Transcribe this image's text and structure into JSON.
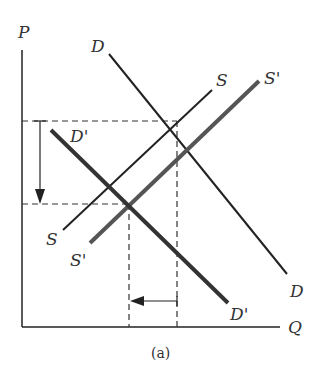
{
  "figure": {
    "caption": "(a)",
    "axes": {
      "y_label": "P",
      "x_label": "Q"
    },
    "curves": {
      "demand": {
        "label_top": "D",
        "label_bottom": "D"
      },
      "demand_shifted": {
        "label_top": "D'",
        "label_bottom": "D'"
      },
      "supply": {
        "label_top": "S",
        "label_bottom": "S"
      },
      "supply_shifted": {
        "label_top": "S'",
        "label_bottom": "S'"
      }
    },
    "annotations": {
      "price_change_arrow": "down",
      "quantity_change_arrow": "left"
    },
    "colors": {
      "line": "#222222",
      "shifted_supply": "#555555",
      "dashed": "#333333"
    }
  }
}
